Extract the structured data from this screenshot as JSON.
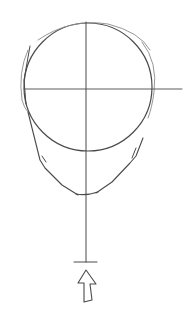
{
  "image": {
    "subject": "head-construction-sketch",
    "description": "Pencil sketch of a front-view head: cranial circle with crosshair guidelines, jaw and chin lines, center line extended down to a tick mark with an upward-pointing arrow",
    "colors": {
      "background": "#ffffff",
      "stroke": "#4a4a4a",
      "light_stroke": "#8a8a8a"
    }
  }
}
